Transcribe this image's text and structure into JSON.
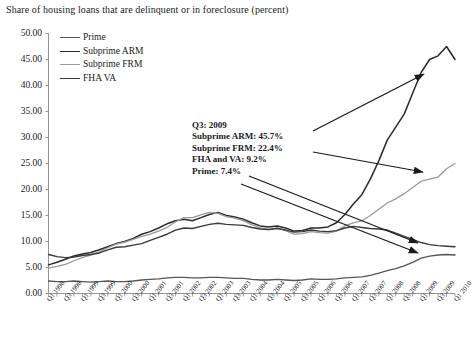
{
  "chart_data": {
    "type": "line",
    "title": "Share of housing loans that are delinquent or in foreclosure (percent)",
    "xlabel": "",
    "ylabel": "",
    "ylim": [
      0,
      50
    ],
    "ytick_step": 5,
    "grid": false,
    "legend_position": "top-left",
    "ytick_labels": [
      "50.00",
      "45.00",
      "40.00",
      "35.00",
      "30.00",
      "25.00",
      "20.00",
      "15.00",
      "10.00",
      "5.00",
      "0.00"
    ],
    "categories": [
      "Q1 1998",
      "Q2 1998",
      "Q3 1998",
      "Q4 1998",
      "Q1 1999",
      "Q2 1999",
      "Q3 1999",
      "Q4 1999",
      "Q1 2000",
      "Q2 2000",
      "Q3 2000",
      "Q4 2000",
      "Q1 2001",
      "Q2 2001",
      "Q3 2001",
      "Q4 2001",
      "Q1 2002",
      "Q2 2002",
      "Q3 2002",
      "Q4 2002",
      "Q1 2003",
      "Q2 2003",
      "Q3 2003",
      "Q4 2003",
      "Q1 2004",
      "Q2 2004",
      "Q3 2004",
      "Q4 2004",
      "Q1 2005",
      "Q2 2005",
      "Q3 2005",
      "Q4 2005",
      "Q1 2006",
      "Q2 2006",
      "Q3 2006",
      "Q4 2006",
      "Q1 2007",
      "Q2 2007",
      "Q3 2007",
      "Q4 2007",
      "Q1 2008",
      "Q2 2008",
      "Q3 2008",
      "Q4 2008",
      "Q1 2009",
      "Q2 2009",
      "Q3 2009",
      "Q4 2009",
      "Q1 2010"
    ],
    "xtick_labels": [
      "Q1 1998",
      "Q3 1998",
      "Q1 1999",
      "Q3 1999",
      "Q1 2000",
      "Q3 2000",
      "Q1 2001",
      "Q3 2001",
      "Q1 2002",
      "Q3 2002",
      "Q1 2003",
      "Q3 2003",
      "Q1 2004",
      "Q3 2004",
      "Q1 2005",
      "Q3 2005",
      "Q1 2006",
      "Q3 2006",
      "Q1 2007",
      "Q3 2007",
      "Q1 2008",
      "Q3 2008",
      "Q1 2009",
      "Q3 2009",
      "Q1 2010"
    ],
    "series": [
      {
        "name": "Prime",
        "color": "#55555a",
        "width": 1.3,
        "values": [
          2.4,
          2.3,
          2.3,
          2.4,
          2.3,
          2.2,
          2.3,
          2.4,
          2.3,
          2.3,
          2.4,
          2.6,
          2.7,
          2.8,
          3.0,
          3.1,
          3.1,
          3.0,
          3.0,
          3.1,
          3.1,
          3.0,
          2.9,
          2.9,
          2.7,
          2.6,
          2.6,
          2.7,
          2.6,
          2.5,
          2.6,
          2.8,
          2.7,
          2.7,
          2.8,
          3.0,
          3.1,
          3.2,
          3.5,
          3.9,
          4.4,
          4.8,
          5.3,
          6.0,
          6.8,
          7.2,
          7.4,
          7.5,
          7.4
        ]
      },
      {
        "name": "Subprime ARM",
        "color": "#2a2a2e",
        "width": 1.5,
        "values": [
          5.5,
          6.0,
          6.6,
          7.2,
          7.6,
          7.9,
          8.4,
          9.0,
          9.6,
          10.0,
          10.6,
          11.4,
          11.9,
          12.6,
          13.4,
          14.0,
          14.3,
          14.0,
          14.6,
          15.2,
          15.6,
          15.0,
          14.7,
          14.3,
          13.6,
          13.0,
          12.8,
          13.0,
          12.6,
          12.0,
          12.1,
          12.6,
          12.6,
          12.8,
          13.6,
          15.2,
          17.2,
          19.0,
          22.0,
          25.5,
          29.5,
          32.0,
          34.5,
          38.5,
          42.5,
          45.0,
          45.7,
          47.5,
          45.0
        ]
      },
      {
        "name": "Subprime FRM",
        "color": "#9a9a9e",
        "width": 1.3,
        "values": [
          4.9,
          5.2,
          5.6,
          6.3,
          6.9,
          7.4,
          8.0,
          8.8,
          9.5,
          9.9,
          10.4,
          11.0,
          11.4,
          12.0,
          12.7,
          13.8,
          14.6,
          14.6,
          15.1,
          15.6,
          15.4,
          14.8,
          14.5,
          14.0,
          13.2,
          12.6,
          12.3,
          12.6,
          12.1,
          11.4,
          11.5,
          11.9,
          11.7,
          11.6,
          12.0,
          13.0,
          13.6,
          14.0,
          15.0,
          16.2,
          17.4,
          18.2,
          19.2,
          20.4,
          21.6,
          22.0,
          22.4,
          24.0,
          25.0
        ]
      },
      {
        "name": "FHA VA",
        "color": "#3a3a3e",
        "width": 1.4,
        "values": [
          7.5,
          7.1,
          6.9,
          7.0,
          7.3,
          7.5,
          7.8,
          8.4,
          8.9,
          9.0,
          9.3,
          9.6,
          10.2,
          10.8,
          11.4,
          12.2,
          12.6,
          12.5,
          12.9,
          13.3,
          13.5,
          13.3,
          13.2,
          13.1,
          12.7,
          12.4,
          12.3,
          12.5,
          12.2,
          11.8,
          11.9,
          12.2,
          12.0,
          11.9,
          12.1,
          12.6,
          12.9,
          12.7,
          12.5,
          12.4,
          12.2,
          11.6,
          11.0,
          10.4,
          9.8,
          9.4,
          9.2,
          9.1,
          9.0
        ]
      }
    ],
    "legend": [
      {
        "label": "Prime",
        "color": "#55555a"
      },
      {
        "label": "Subprime ARM",
        "color": "#2a2a2e"
      },
      {
        "label": "Subprime FRM",
        "color": "#9a9a9e"
      },
      {
        "label": "FHA VA",
        "color": "#3a3a3e"
      }
    ],
    "annotation": {
      "lines": [
        "Q3: 2009",
        "Subprime ARM: 45.7%",
        "Subprime FRM: 22.4%",
        "FHA and VA: 9.2%",
        "Prime: 7.4%"
      ],
      "callouts": [
        {
          "target_series": "Subprime ARM",
          "target_value": 45.7
        },
        {
          "target_series": "Subprime FRM",
          "target_value": 22.4
        },
        {
          "target_series": "FHA and VA",
          "target_value": 9.2
        },
        {
          "target_series": "Prime",
          "target_value": 7.4
        }
      ]
    }
  }
}
